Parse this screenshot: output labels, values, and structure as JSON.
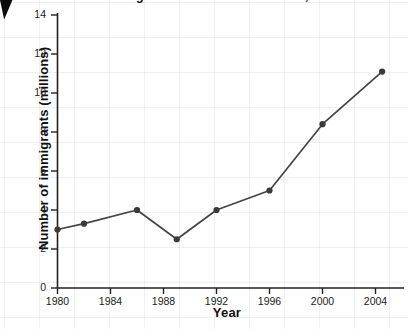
{
  "chart_data": {
    "type": "line",
    "title": "Immigration to the United States, 1980-2005",
    "xlabel": "Year",
    "ylabel": "Number of immigrants (millions)",
    "x": [
      1980,
      1982,
      1986,
      1989,
      1992,
      1996,
      2000,
      2004.5
    ],
    "values": [
      3.0,
      3.3,
      4.0,
      2.5,
      4.0,
      5.0,
      8.4,
      11.1
    ],
    "series": [
      {
        "name": "Number of immigrants",
        "values": [
          3.0,
          3.3,
          4.0,
          2.5,
          4.0,
          5.0,
          8.4,
          11.1
        ]
      }
    ],
    "xlim": [
      1980,
      2005.5
    ],
    "ylim": [
      0,
      14
    ],
    "xticks": [
      1980,
      1984,
      1988,
      1992,
      1996,
      2000,
      2004
    ],
    "yticks": [
      0,
      2,
      4,
      6,
      8,
      10,
      12,
      14
    ],
    "xtick_labels": [
      "1980",
      "1984",
      "1988",
      "1992",
      "1996",
      "2000",
      "2004"
    ],
    "ytick_labels": [
      "0",
      "2",
      "4",
      "6",
      "8",
      "10",
      "12",
      "14"
    ],
    "grid": true,
    "legend": false,
    "legend_position": "none",
    "line_color": "#444444",
    "marker_color": "#3a3a3a",
    "marker": "circle",
    "background_color": "#ffffff",
    "grid_color": "#c8cdd7"
  },
  "cursor": {
    "icon": "arrow-cursor-icon"
  }
}
